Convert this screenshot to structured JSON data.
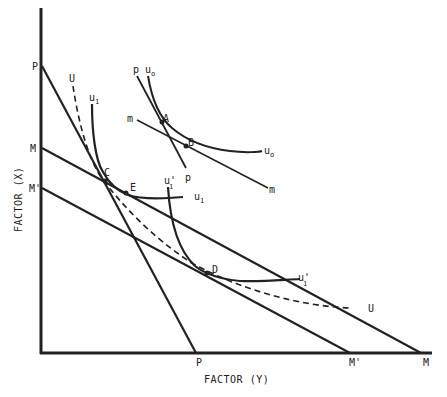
{
  "diagram": {
    "title": "",
    "x_axis_label": "FACTOR (Y)",
    "y_axis_label": "FACTOR (X)",
    "lines": [
      {
        "name": "P-P",
        "start_label": "P",
        "end_label": "P"
      },
      {
        "name": "M-M",
        "start_label": "M",
        "end_label": "M"
      },
      {
        "name": "M'-M'",
        "start_label": "M'",
        "end_label": "M'"
      },
      {
        "name": "p-p",
        "start_label": "p",
        "end_label": "p"
      },
      {
        "name": "m-m",
        "start_label": "m",
        "end_label": "m"
      }
    ],
    "curves": [
      {
        "name": "U (dashed)",
        "label_start": "U",
        "label_end": "U",
        "style": "dashed"
      },
      {
        "name": "u1",
        "label": "u",
        "subscript": "1"
      },
      {
        "name": "u1'",
        "label": "u",
        "subscript": "1",
        "prime": "'"
      },
      {
        "name": "u0",
        "label": "u",
        "subscript": "o"
      }
    ],
    "points": {
      "A": "A",
      "B": "B",
      "C": "C",
      "D": "D",
      "E": "E"
    },
    "labels": {
      "P_y": "P",
      "M_y": "M",
      "Mp_y": "M'",
      "P_x": "P",
      "Mp_x": "M'",
      "M_x": "M",
      "p_top": "p",
      "p_bottom": "p",
      "m_left": "m",
      "m_right": "m",
      "U_top": "U",
      "U_right": "U",
      "u": "u",
      "sub1": "1",
      "sub0": "o",
      "prime": "'"
    }
  }
}
